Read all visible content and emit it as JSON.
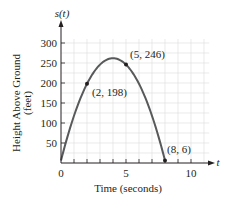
{
  "chart_data": {
    "type": "line",
    "title": "",
    "xlabel": "Time (seconds)",
    "ylabel": "Height Above Ground (feet)",
    "ylabel_line1": "Height Above Ground",
    "ylabel_line2": "(feet)",
    "x_axis_name": "t",
    "y_axis_name": "s(t)",
    "xlim": [
      0,
      11.5
    ],
    "ylim": [
      0,
      330
    ],
    "x_ticks": [
      0,
      5,
      10
    ],
    "x_minor_ticks": [
      1,
      2,
      3,
      4,
      6,
      7,
      8,
      9
    ],
    "y_ticks": [
      50,
      100,
      150,
      200,
      250,
      300
    ],
    "grid": true,
    "legend": null,
    "series": [
      {
        "name": "s(t)",
        "description": "parabolic height curve",
        "x": [
          0,
          1,
          2,
          3,
          4,
          5,
          6,
          7,
          8
        ],
        "y": [
          6,
          118,
          198,
          246,
          262,
          246,
          198,
          118,
          6
        ],
        "color": "#58595b"
      }
    ],
    "annotations": [
      {
        "x": 2,
        "y": 198,
        "text": "(2, 198)"
      },
      {
        "x": 5,
        "y": 246,
        "text": "(5, 246)"
      },
      {
        "x": 8,
        "y": 6,
        "text": "(8, 6)"
      }
    ],
    "tick_labels": {
      "x": [
        "0",
        "5",
        "10"
      ],
      "y": [
        "50",
        "100",
        "150",
        "200",
        "250",
        "300"
      ]
    }
  }
}
